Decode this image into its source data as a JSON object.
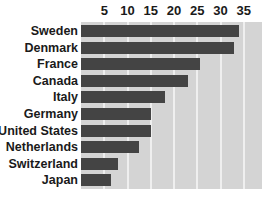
{
  "chart": {
    "type": "bar",
    "orientation": "horizontal",
    "title": "",
    "xlabel": "",
    "ylabel": "",
    "plot_background_color": "#d4d4d4",
    "bar_color": "#444444",
    "gridline_color": "#efefef",
    "grid": true,
    "legend": "none"
  },
  "chart_data": {
    "type": "bar",
    "title": "",
    "xlabel": "",
    "ylabel": "",
    "xlim": [
      0,
      38.5
    ],
    "xticks": [
      5,
      10,
      15,
      20,
      25,
      30,
      35
    ],
    "grid": true,
    "legend": "none",
    "orientation": "horizontal",
    "categories": [
      "Sweden",
      "Denmark",
      "France",
      "Canada",
      "Italy",
      "Germany",
      "United States",
      "Netherlands",
      "Switzerland",
      "Japan"
    ],
    "values": [
      34,
      33,
      25.5,
      23,
      18,
      15,
      15,
      12.5,
      8,
      6.5
    ]
  },
  "axis": {
    "ticks": [
      {
        "label": "5",
        "value": 5
      },
      {
        "label": "10",
        "value": 10
      },
      {
        "label": "15",
        "value": 15
      },
      {
        "label": "20",
        "value": 20
      },
      {
        "label": "25",
        "value": 25
      },
      {
        "label": "30",
        "value": 30
      },
      {
        "label": "35",
        "value": 35
      }
    ]
  },
  "rows": [
    {
      "label": "Sweden",
      "value": 34
    },
    {
      "label": "Denmark",
      "value": 33
    },
    {
      "label": "France",
      "value": 25.5
    },
    {
      "label": "Canada",
      "value": 23
    },
    {
      "label": "Italy",
      "value": 18
    },
    {
      "label": "Germany",
      "value": 15
    },
    {
      "label": "United States",
      "value": 15
    },
    {
      "label": "Netherlands",
      "value": 12.5
    },
    {
      "label": "Switzerland",
      "value": 8
    },
    {
      "label": "Japan",
      "value": 6.5
    }
  ]
}
